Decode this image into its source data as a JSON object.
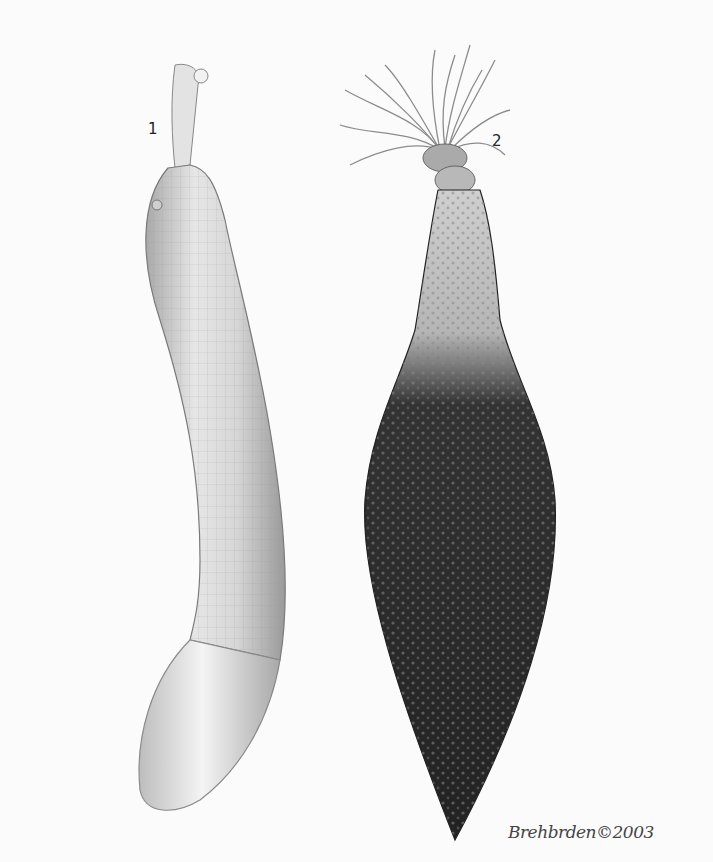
{
  "illustration": {
    "subject": "Two worm-like marine animals (sea cucumber / peanut-worm style specimens)",
    "background_color": "#fbfbfb",
    "specimens": [
      {
        "id": 1,
        "label": "1",
        "description": "Pale, slender, curved body with grid-like striations, small retracted head at top and smooth rounded bulb at bottom",
        "color": "#d8d8d8"
      },
      {
        "id": 2,
        "label": "2",
        "description": "Dark, warty, club-shaped body tapering to a point, pale neck with crown of feathery tentacles at top",
        "color": "#2e2e2e"
      }
    ],
    "signature": "Brehbrden©2003"
  }
}
